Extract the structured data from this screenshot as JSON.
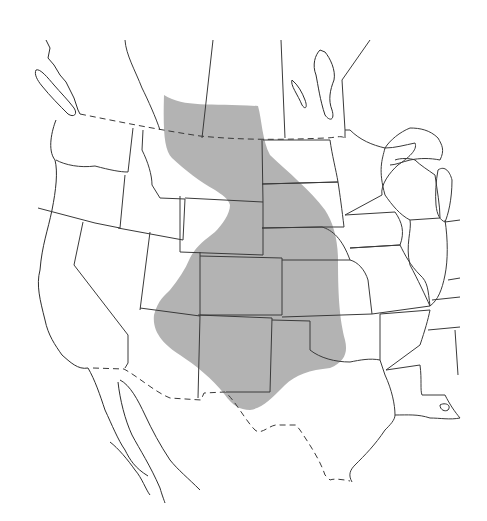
{
  "map": {
    "type": "species range map",
    "region": "Western and central North America (United States, southern Canada, northern Mexico)",
    "labels": [],
    "range": {
      "description": "Shaded distribution area across the Great Plains from southern Alberta/Saskatchewan south to eastern New Mexico and west Texas",
      "fill_color": "#b3b3b3"
    },
    "line_color": "#3a3a3a",
    "background_color": "#ffffff",
    "boundaries": {
      "international": "dashed",
      "state_province": "solid"
    }
  }
}
